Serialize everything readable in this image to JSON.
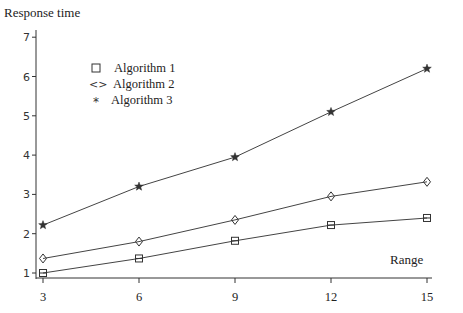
{
  "chart_data": {
    "type": "line",
    "title": "",
    "ylabel": "Response time",
    "xlabel": "Range",
    "x": [
      3,
      6,
      9,
      12,
      15
    ],
    "xticks": [
      3,
      6,
      9,
      12,
      15
    ],
    "yticks": [
      1,
      2,
      3,
      4,
      5,
      6,
      7
    ],
    "ylim": [
      0.87,
      7
    ],
    "xlim": [
      3,
      15.2
    ],
    "grid": false,
    "legend_position": "upper-left inside",
    "series": [
      {
        "name": "Algorithm 1",
        "marker": "square",
        "legend_symbol": "□",
        "values": [
          1.0,
          1.37,
          1.82,
          2.22,
          2.4
        ]
      },
      {
        "name": "Algorithm 2",
        "marker": "diamond",
        "legend_symbol": "<>",
        "values": [
          1.37,
          1.8,
          2.35,
          2.95,
          3.32
        ]
      },
      {
        "name": "Algorithm 3",
        "marker": "star",
        "legend_symbol": "*",
        "values": [
          2.22,
          3.2,
          3.95,
          5.1,
          6.2
        ]
      }
    ]
  },
  "labels": {
    "y_axis_title": "Response time",
    "x_axis_title": "Range"
  },
  "legend": {
    "items": [
      {
        "symbol": "□",
        "label": "Algorithm 1"
      },
      {
        "symbol": "<>",
        "label": "Algorithm 2"
      },
      {
        "symbol": "*",
        "label": "Algorithm 3"
      }
    ]
  },
  "colors": {
    "line": "#444444",
    "axis": "#333333",
    "background": "#ffffff"
  }
}
